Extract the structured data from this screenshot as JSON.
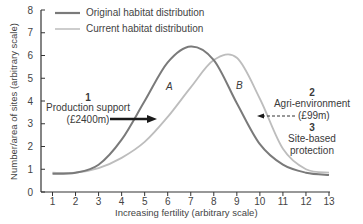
{
  "chart_data": {
    "type": "line",
    "title": "",
    "xlabel": "Increasing fertility (arbitrary scale)",
    "ylabel": "Number/area of sites (arbitrary scale)",
    "xlim": [
      1,
      13
    ],
    "ylim": [
      0,
      8
    ],
    "x_ticks": [
      1,
      2,
      3,
      4,
      5,
      6,
      7,
      8,
      9,
      10,
      11,
      12,
      13
    ],
    "y_ticks": [
      0,
      1,
      2,
      3,
      4,
      5,
      6,
      7,
      8
    ],
    "grid": false,
    "legend_position": "top",
    "series": [
      {
        "name": "Original habitat distribution",
        "color": "#7a7a7a",
        "x": [
          1,
          2,
          3,
          4,
          5,
          6,
          7,
          8,
          9,
          10,
          11,
          12,
          13
        ],
        "y": [
          0.8,
          0.85,
          1.2,
          2.3,
          4.0,
          5.7,
          6.4,
          5.8,
          3.9,
          2.1,
          1.2,
          0.85,
          0.75
        ]
      },
      {
        "name": "Current habitat distribution",
        "color": "#bdbdbd",
        "x": [
          1,
          2,
          3,
          4,
          5,
          6,
          7,
          8,
          9,
          10,
          11,
          12,
          13
        ],
        "y": [
          0.85,
          0.85,
          1.05,
          1.5,
          2.2,
          3.3,
          4.6,
          5.8,
          5.9,
          4.1,
          1.9,
          1.0,
          0.85
        ]
      }
    ],
    "annotations": [
      {
        "label": "A",
        "x": 6.3,
        "y": 4.6
      },
      {
        "label": "B",
        "x": 9.3,
        "y": 4.7
      },
      {
        "number": "1",
        "text": "Production support",
        "amount": "(£2400m)",
        "arrow": "solid, pointing right toward higher fertility"
      },
      {
        "number": "2",
        "text": "Agri-environment",
        "amount": "(£99m)",
        "arrow": "dashed, pointing left toward lower fertility"
      },
      {
        "number": "3",
        "text": "Site-based protection"
      }
    ]
  },
  "legend": {
    "original": "Original habitat distribution",
    "current": "Current habitat distribution"
  },
  "axes": {
    "xlabel": "Increasing fertility (arbitrary scale)",
    "ylabel": "Number/area of sites (arbitrary scale)",
    "x_ticks": [
      "1",
      "2",
      "3",
      "4",
      "5",
      "6",
      "7",
      "8",
      "9",
      "10",
      "11",
      "12",
      "13"
    ],
    "y_ticks": [
      "0",
      "1",
      "2",
      "3",
      "4",
      "5",
      "6",
      "7",
      "8"
    ]
  },
  "labels": {
    "a": "A",
    "b": "B",
    "one_num": "1",
    "one_text": "Production support",
    "one_amount": "(£2400m)",
    "two_num": "2",
    "two_text": "Agri-environment",
    "two_amount": "(£99m)",
    "three_num": "3",
    "three_text_1": "Site-based",
    "three_text_2": "protection"
  },
  "colors": {
    "original": "#7a7a7a",
    "current": "#bdbdbd",
    "axis": "#333333",
    "arrow": "#1a1a1a"
  }
}
